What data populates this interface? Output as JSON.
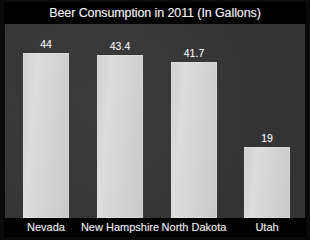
{
  "chart_data": {
    "type": "bar",
    "title": "Beer Consumption in 2011 (In Gallons)",
    "xlabel": "",
    "ylabel": "",
    "categories": [
      "Nevada",
      "New Hampshire",
      "North Dakota",
      "Utah"
    ],
    "values": [
      44,
      43.4,
      41.7,
      19
    ],
    "value_labels": [
      "44",
      "43.4",
      "41.7",
      "19"
    ],
    "ylim": [
      0,
      52
    ],
    "grid": false,
    "legend": "none",
    "series": [
      {
        "name": "Beer Consumption (Gallons)",
        "values": [
          44,
          43.4,
          41.7,
          19
        ]
      }
    ]
  },
  "style": {
    "background_color": "#000000",
    "plot_background_color": "#343434",
    "bar_color": "#d5d5d5",
    "title_color": "#f2f2f2",
    "label_color": "#ededed"
  }
}
